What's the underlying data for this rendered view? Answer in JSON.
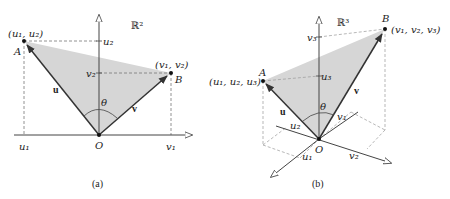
{
  "figure_a": {
    "caption": "(a)",
    "space_label": "ℝ²",
    "origin_label": "O",
    "point_A": {
      "name": "A",
      "coords": "(u₁, u₂)"
    },
    "point_B": {
      "name": "B",
      "coords": "(v₁, v₂)"
    },
    "vector_u": "u",
    "vector_v": "v",
    "angle": "θ",
    "x_ticks": {
      "u1": "u₁",
      "v1": "v₁"
    },
    "y_ticks": {
      "u2": "u₂",
      "v2": "v₂"
    },
    "colors": {
      "fill": "#d6d6d6",
      "line": "#333333",
      "dash": "#777777"
    }
  },
  "figure_b": {
    "caption": "(b)",
    "space_label": "ℝ³",
    "origin_label": "O",
    "point_A": {
      "name": "A",
      "coords": "(u₁, u₂, u₃)"
    },
    "point_B": {
      "name": "B",
      "coords": "(v₁, v₂, v₃)"
    },
    "vector_u": "u",
    "vector_v": "v",
    "angle": "θ",
    "axis_labels": {
      "u1": "u₁",
      "u2": "u₂",
      "u3": "u₃",
      "v1": "v₁",
      "v2": "v₂",
      "v3": "v₃"
    },
    "colors": {
      "fill": "#d6d6d6",
      "line": "#333333",
      "dash": "#999999"
    }
  }
}
